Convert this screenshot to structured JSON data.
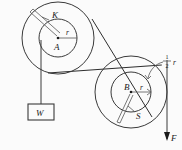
{
  "figure": {
    "background_color": "#fbfbfb",
    "line_color": "#3a3a3a",
    "labels": {
      "left_center": "A",
      "left_rope": "K",
      "left_radius": "r",
      "right_center": "B",
      "right_radius": "r",
      "right_rope": "S",
      "weight": "W",
      "force": "F",
      "half_radius_numerator": "1",
      "half_radius_denominator": "2",
      "half_radius_unit": "r"
    }
  },
  "geometry": {
    "left_pulley": {
      "center_x": 58,
      "center_y": 38,
      "outer_radius": 36,
      "inner_radius": 19
    },
    "right_pulley": {
      "center_x": 131,
      "center_y": 92,
      "outer_radius": 36,
      "inner_radius": 20
    },
    "weight_box": {
      "x": 28,
      "y": 104,
      "width": 26,
      "height": 16
    },
    "force_arrow": {
      "x": 167,
      "y_start": 60,
      "y_end": 140
    }
  }
}
